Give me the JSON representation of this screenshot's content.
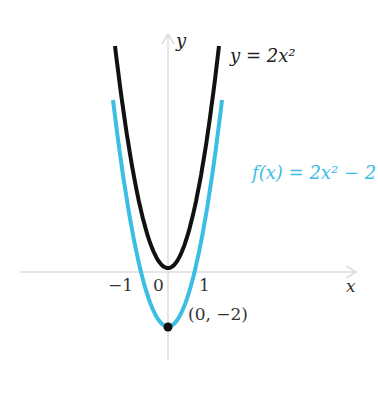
{
  "chart_data": {
    "type": "line",
    "title": "",
    "xlabel": "x",
    "ylabel": "y",
    "x_ticks": [
      "-1",
      "0",
      "1"
    ],
    "series": [
      {
        "name": "y = 2x^2",
        "label": "y = 2x²",
        "color": "#111111",
        "formula": "2*x^2",
        "x_range": [
          -2.2,
          2.1
        ]
      },
      {
        "name": "f(x) = 2x^2 - 2",
        "label": "f(x) = 2x² − 2",
        "color": "#3bbde4",
        "formula": "2*x^2-2",
        "x_range": [
          -2.3,
          2.25
        ]
      }
    ],
    "annotations": [
      {
        "point": [
          0,
          -2
        ],
        "text": "(0, −2)"
      }
    ],
    "grid": false
  },
  "labels": {
    "y_axis": "y",
    "x_axis": "x",
    "curve1": "y = 2x²",
    "curve2": "f(x) = 2x² − 2",
    "point": "(0, −2)",
    "tick_neg1": "−1",
    "tick_0": "0",
    "tick_1": "1"
  }
}
